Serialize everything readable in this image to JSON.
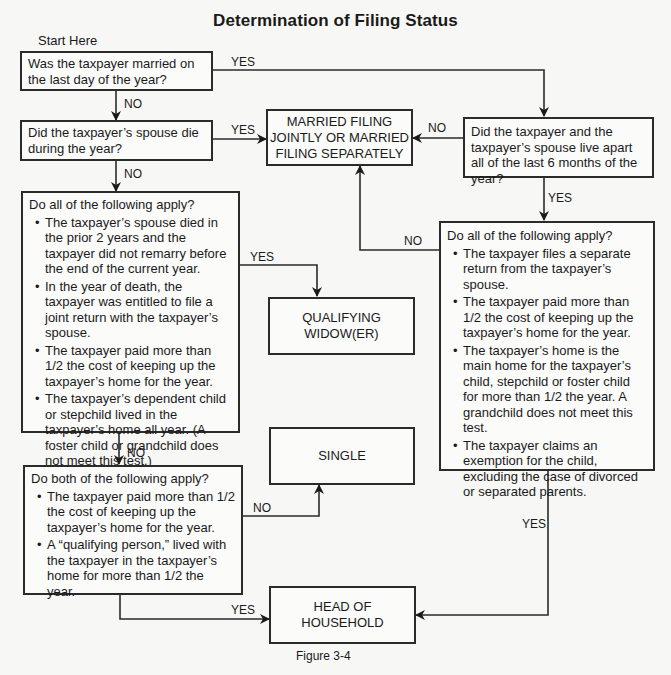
{
  "title": "Determination of Filing Status",
  "start_label": "Start Here",
  "nodes": {
    "q_married": {
      "text": "Was the taxpayer married on the last day of the year?"
    },
    "q_spouse_died": {
      "text": "Did the taxpayer’s spouse die during the year?"
    },
    "q_widow_tests": {
      "heading": "Do all of the following apply?",
      "bullets": [
        "The taxpayer’s spouse died in the prior 2 years and the taxpayer did not remarry before the end of the current year.",
        "In the year of death, the taxpayer was entitled to file a joint return with the taxpayer’s spouse.",
        "The taxpayer paid more than 1/2 the cost of keeping up the taxpayer’s home for the year.",
        "The taxpayer’s dependent child or stepchild lived in the taxpayer’s home all year. (A foster child or grandchild does not meet this test.)"
      ]
    },
    "q_hoh_tests": {
      "heading": "Do both of the following apply?",
      "bullets": [
        "The taxpayer paid more than 1/2 the cost of keeping up the taxpayer’s home for the year.",
        "A “qualifying person,” lived with the taxpayer in the taxpayer’s home for more than 1/2 the year."
      ]
    },
    "q_live_apart": {
      "text": "Did the taxpayer and the taxpayer’s spouse live apart all of the last 6 months of the year?"
    },
    "q_abandoned_tests": {
      "heading": "Do all of the following apply?",
      "bullets": [
        "The taxpayer files a separate return from the taxpayer’s spouse.",
        "The taxpayer paid more than 1/2 the cost of keeping up the taxpayer’s home for the year.",
        "The taxpayer’s home is the main home for the taxpayer’s child, stepchild or foster child for more than 1/2 the year. A grandchild does not meet this test.",
        "The taxpayer claims an exemption for the child, excluding the case of divorced or separated parents."
      ]
    },
    "o_married": {
      "line1": "MARRIED FILING",
      "line2": "JOINTLY OR MARRIED",
      "line3": "FILING SEPARATELY"
    },
    "o_widow": {
      "line1": "QUALIFYING",
      "line2": "WIDOW(ER)"
    },
    "o_single": {
      "line1": "SINGLE"
    },
    "o_hoh": {
      "line1": "HEAD OF",
      "line2": "HOUSEHOLD"
    }
  },
  "edges": {
    "married_yes": "YES",
    "married_no": "NO",
    "died_yes": "YES",
    "died_no": "NO",
    "widow_yes": "YES",
    "widow_no": "NO",
    "hoh_no": "NO",
    "hoh_yes": "YES",
    "apart_no": "NO",
    "apart_yes": "YES",
    "abandoned_no": "NO",
    "abandoned_yes": "YES"
  },
  "caption": "Figure 3-4"
}
